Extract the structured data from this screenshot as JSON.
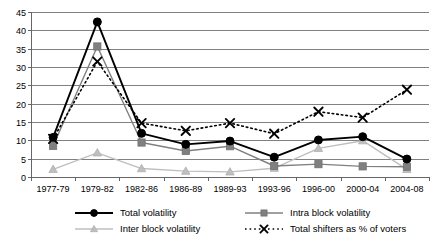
{
  "chart_data": {
    "type": "line",
    "title": "",
    "subtitle": "",
    "xlabel": "",
    "ylabel": "",
    "categories": [
      "1977-79",
      "1979-82",
      "1982-86",
      "1986-89",
      "1989-93",
      "1993-96",
      "1996-00",
      "2000-04",
      "2004-08"
    ],
    "ylim": [
      0,
      45
    ],
    "ytick_values": [
      0,
      5,
      10,
      15,
      20,
      25,
      30,
      35,
      40,
      45
    ],
    "ytick_labels": [
      "0",
      "5",
      "10",
      "15",
      "20",
      "25",
      "30",
      "35",
      "40",
      "45"
    ],
    "grid": true,
    "legend_position": "bottom",
    "series": [
      {
        "name": "Total volatility",
        "marker": "circle",
        "color": "#000000",
        "linestyle": "solid",
        "values": [
          10.8,
          42.3,
          11.9,
          8.9,
          9.8,
          5.4,
          10.1,
          11.0,
          4.9
        ]
      },
      {
        "name": "Intra block volatility",
        "marker": "square",
        "color": "#808080",
        "linestyle": "solid",
        "values": [
          8.5,
          35.6,
          9.4,
          7.1,
          8.4,
          3.0,
          3.5,
          2.9,
          2.8
        ]
      },
      {
        "name": "Inter block volatility",
        "marker": "triangle",
        "color": "#bfbfbf",
        "linestyle": "solid",
        "values": [
          2.1,
          6.6,
          2.3,
          1.6,
          1.4,
          2.4,
          7.8,
          9.9,
          2.1
        ]
      },
      {
        "name": "Total shifters as % of voters",
        "marker": "x",
        "color": "#000000",
        "linestyle": "dotted",
        "values": [
          10.4,
          31.5,
          14.7,
          12.6,
          14.7,
          11.8,
          17.8,
          16.2,
          23.8
        ]
      }
    ]
  },
  "legend": {
    "items": [
      {
        "label": "Total volatility"
      },
      {
        "label": "Intra block volatility"
      },
      {
        "label": "Inter block volatility"
      },
      {
        "label": "Total shifters as % of voters"
      }
    ]
  }
}
